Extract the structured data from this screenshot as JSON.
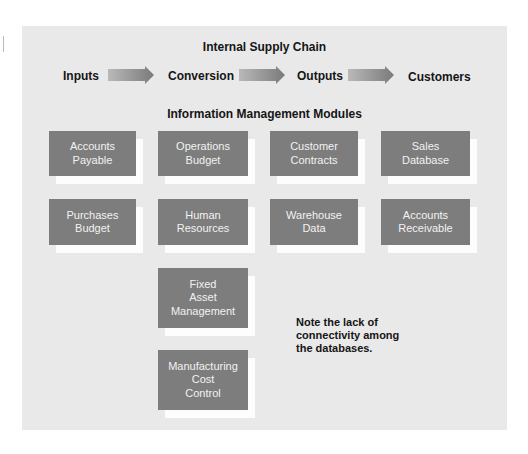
{
  "diagram": {
    "title": "Internal Supply Chain",
    "flow": [
      {
        "label": "Inputs"
      },
      {
        "label": "Conversion"
      },
      {
        "label": "Outputs"
      },
      {
        "label": "Customers"
      }
    ],
    "arrow_icon": "right-arrow-icon",
    "modules_title": "Information Management Modules",
    "modules": [
      {
        "label": "Accounts\nPayable"
      },
      {
        "label": "Operations\nBudget"
      },
      {
        "label": "Customer\nContracts"
      },
      {
        "label": "Sales\nDatabase"
      },
      {
        "label": "Purchases\nBudget"
      },
      {
        "label": "Human\nResources"
      },
      {
        "label": "Warehouse\nData"
      },
      {
        "label": "Accounts\nReceivable"
      },
      {
        "label": "Fixed\nAsset\nManagement"
      },
      {
        "label": "Manufacturing\nCost\nControl"
      }
    ],
    "note": "Note the lack of\nconnectivity among\nthe databases.",
    "colors": {
      "panel": "#e9e9e9",
      "module_box": "#7d7d7d",
      "module_shadow": "#fdfdfd",
      "module_text": "#f2f2f2",
      "text": "#151515"
    }
  }
}
